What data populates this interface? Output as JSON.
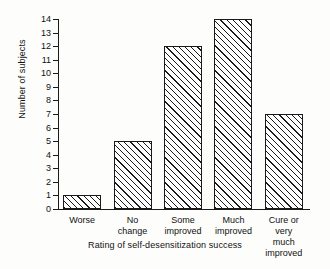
{
  "chart_data": {
    "type": "bar",
    "title": "",
    "categories": [
      "Worse",
      "No\nchange",
      "Some\nimproved",
      "Much\nimproved",
      "Cure or very\nmuch improved"
    ],
    "values": [
      1,
      5,
      12,
      14,
      7
    ],
    "xlabel": "Rating of self-desensitization  success",
    "ylabel": "Number of subjects",
    "ylim": [
      0,
      14
    ],
    "ytick_labels": [
      "0",
      "1",
      "2",
      "3",
      "4",
      "5",
      "6",
      "7",
      "8",
      "9",
      "10",
      "11",
      "12",
      "13",
      "14"
    ],
    "ytick_values": [
      0,
      1,
      2,
      3,
      4,
      5,
      6,
      7,
      8,
      9,
      10,
      11,
      12,
      13,
      14
    ],
    "grid": false,
    "legend": false,
    "bar_fill": "diagonal-hatch",
    "bar_edge_color": "#1a1a1a",
    "background_color": "#fdfdfb"
  }
}
